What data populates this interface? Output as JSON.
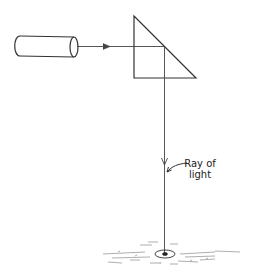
{
  "diagram": {
    "title": "",
    "label": {
      "line1": "Ray of",
      "line2": "light"
    },
    "elements": {
      "light_source": "cylinder-light-source",
      "prism": "right-angle-prism",
      "ray": "ray-of-light",
      "ground": "ground-with-light-spot"
    },
    "stroke_color": "#333333"
  }
}
